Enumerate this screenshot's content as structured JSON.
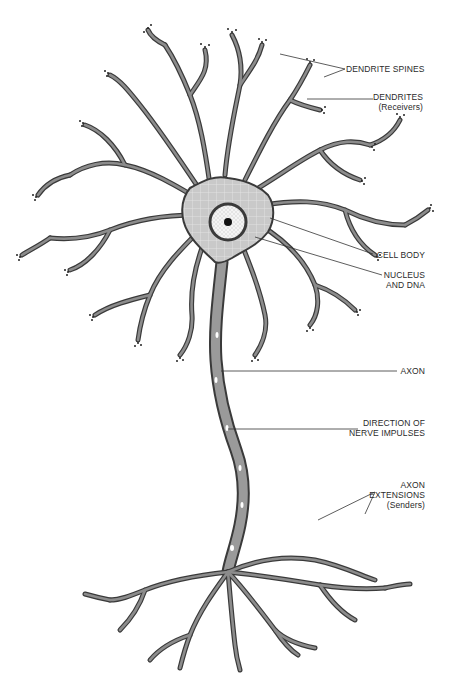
{
  "diagram": {
    "colors": {
      "outline": "#3a3a3a",
      "fill": "#8c8c8c",
      "cell_body": "#c8c8c8",
      "nucleus": "#f2f2f2",
      "nucleolus": "#111111",
      "background": "#ffffff"
    },
    "labels": {
      "dendrite_spines": "DENDRITE SPINES",
      "dendrites": "DENDRITES",
      "dendrites_sub": "(Receivers)",
      "cell_body": "CELL BODY",
      "nucleus_line1": "NUCLEUS",
      "nucleus_line2": "AND DNA",
      "axon": "AXON",
      "direction_line1": "DIRECTION OF",
      "direction_line2": "NERVE IMPULSES",
      "axon_ext_line1": "AXON",
      "axon_ext_line2": "EXTENSIONS",
      "axon_ext_sub": "(Senders)"
    }
  }
}
